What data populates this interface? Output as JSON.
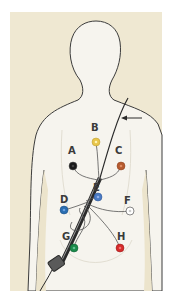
{
  "figure": {
    "background_color": "#efe8d2",
    "body_color": "#f6f4ee",
    "outline_color": "#3c3c3c",
    "arrow_direction": "left"
  },
  "electrodes": [
    {
      "label": "A",
      "color": "#1a1a1a",
      "x": 73,
      "y": 166,
      "label_x": 68,
      "label_y": 146
    },
    {
      "label": "B",
      "color": "#e8c54a",
      "x": 96,
      "y": 142,
      "label_x": 91,
      "label_y": 123
    },
    {
      "label": "C",
      "color": "#b55a2e",
      "x": 121,
      "y": 166,
      "label_x": 115,
      "label_y": 146
    },
    {
      "label": "D",
      "color": "#2a6db0",
      "x": 64,
      "y": 210,
      "label_x": 60,
      "label_y": 195
    },
    {
      "label": "E",
      "color": "#4a7bc4",
      "x": 98,
      "y": 197,
      "label_x": 93,
      "label_y": 183
    },
    {
      "label": "F",
      "color": "#ffffff",
      "x": 130,
      "y": 211,
      "label_x": 124,
      "label_y": 196
    },
    {
      "label": "G",
      "color": "#1a8a4a",
      "x": 74,
      "y": 248,
      "label_x": 62,
      "label_y": 232
    },
    {
      "label": "H",
      "color": "#d62a2a",
      "x": 120,
      "y": 248,
      "label_x": 117,
      "label_y": 232
    }
  ]
}
